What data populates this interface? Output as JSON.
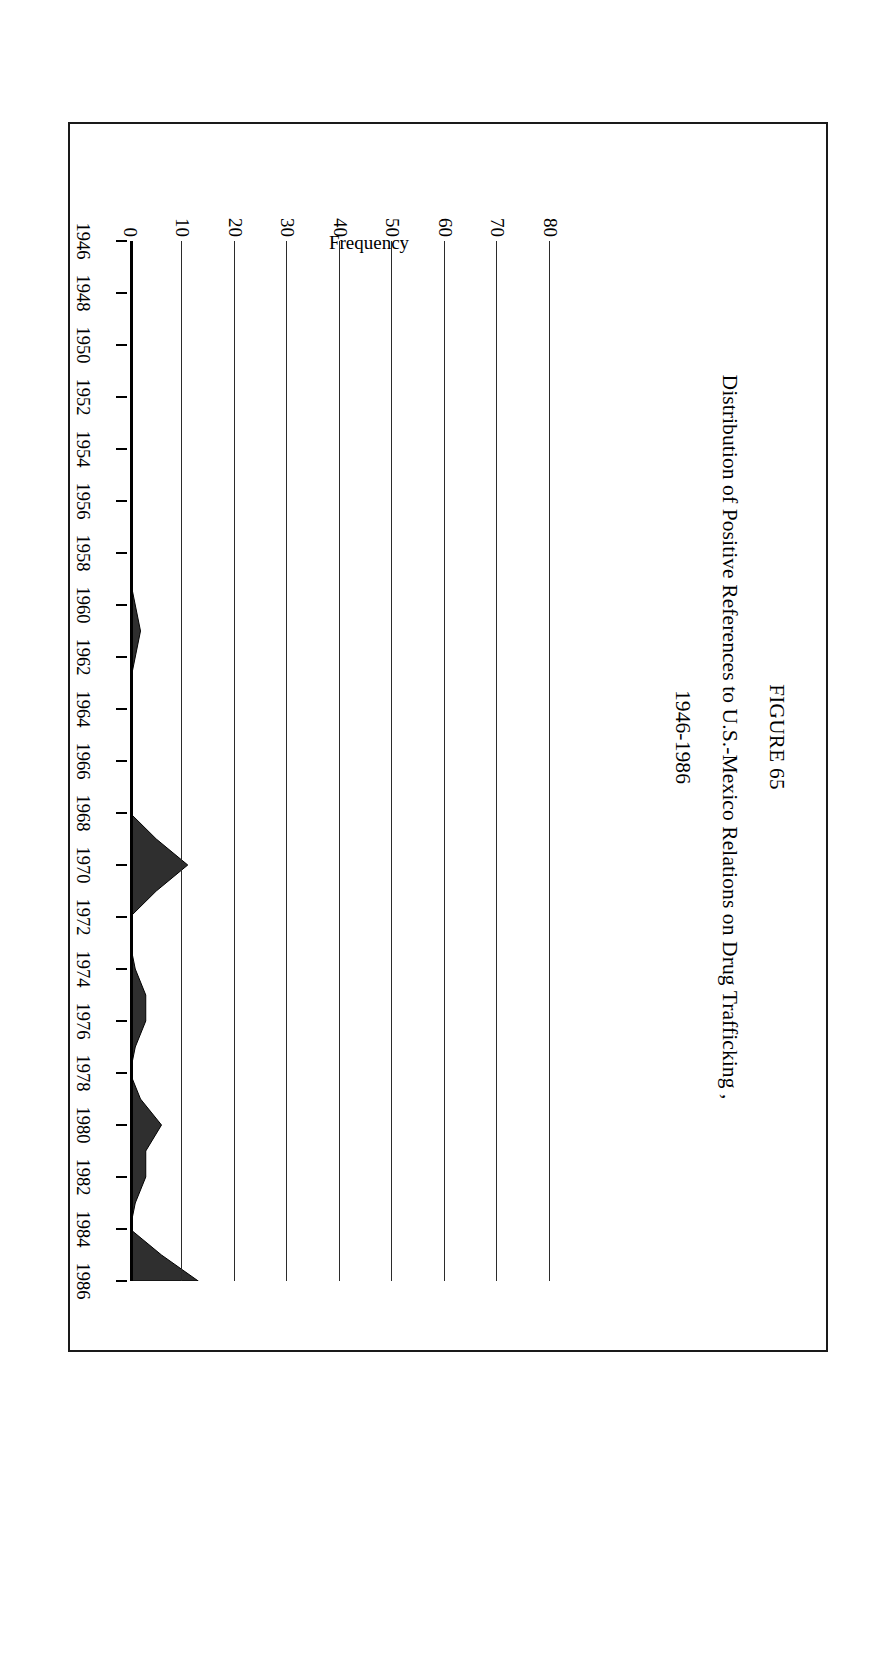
{
  "figure": {
    "number": "FIGURE 65",
    "title": "Distribution of Positive References to U.S.-Mexico Relations on Drug Trafficking ,",
    "subtitle": "1946-1986"
  },
  "axes": {
    "y_label": "Frequency",
    "y_ticks": [
      "0",
      "10",
      "20",
      "30",
      "40",
      "50",
      "60",
      "70",
      "80"
    ],
    "x_labels": [
      "1946",
      "1948",
      "1950",
      "1952",
      "1954",
      "1956",
      "1958",
      "1960",
      "1962",
      "1964",
      "1966",
      "1968",
      "1970",
      "1972",
      "1974",
      "1976",
      "1978",
      "1980",
      "1982",
      "1984",
      "1986"
    ]
  },
  "style": {
    "ink": "#000000",
    "grid": "#2b2b2b",
    "fill": "#2f2f2f",
    "paper": "#ffffff"
  },
  "chart_data": {
    "type": "area",
    "xlabel": "",
    "ylabel": "Frequency",
    "ylim": [
      0,
      80
    ],
    "xlim": [
      1946,
      1986
    ],
    "grid": true,
    "legend": "none",
    "x": [
      1946,
      1947,
      1948,
      1949,
      1950,
      1951,
      1952,
      1953,
      1954,
      1955,
      1956,
      1957,
      1958,
      1959,
      1960,
      1961,
      1962,
      1963,
      1964,
      1965,
      1966,
      1967,
      1968,
      1969,
      1970,
      1971,
      1972,
      1973,
      1974,
      1975,
      1976,
      1977,
      1978,
      1979,
      1980,
      1981,
      1982,
      1983,
      1984,
      1985,
      1986
    ],
    "values": [
      0,
      0,
      0,
      0,
      0,
      0,
      0,
      0,
      0,
      0,
      0,
      0,
      0,
      0,
      1,
      2,
      1,
      0,
      0,
      0,
      0,
      0,
      0,
      5,
      11,
      5,
      0,
      0,
      1,
      3,
      3,
      1,
      0,
      2,
      6,
      3,
      3,
      1,
      0,
      6,
      13
    ],
    "series": [
      {
        "name": "Positive references",
        "values": [
          0,
          0,
          0,
          0,
          0,
          0,
          0,
          0,
          0,
          0,
          0,
          0,
          0,
          0,
          1,
          2,
          1,
          0,
          0,
          0,
          0,
          0,
          0,
          5,
          11,
          5,
          0,
          0,
          1,
          3,
          3,
          1,
          0,
          2,
          6,
          3,
          3,
          1,
          0,
          6,
          13
        ]
      }
    ],
    "ytick_values": [
      0,
      10,
      20,
      30,
      40,
      50,
      60,
      70,
      80
    ],
    "xtick_values": [
      1946,
      1948,
      1950,
      1952,
      1954,
      1956,
      1958,
      1960,
      1962,
      1964,
      1966,
      1968,
      1970,
      1972,
      1974,
      1976,
      1978,
      1980,
      1982,
      1984,
      1986
    ]
  }
}
